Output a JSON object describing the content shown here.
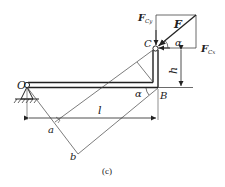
{
  "figure": {
    "caption": "(c)",
    "labels": {
      "O": "O",
      "B": "B",
      "C": "C",
      "a": "a",
      "b": "b",
      "l": "l",
      "h": "h",
      "alpha_top": "α",
      "alpha_bottom": "α",
      "F": "F",
      "F_Cy_main": "F",
      "F_Cy_sub": "Cy",
      "F_Cx_main": "F",
      "F_Cx_sub": "Cx"
    },
    "colors": {
      "line": "#333333",
      "background": "#ffffff"
    }
  }
}
